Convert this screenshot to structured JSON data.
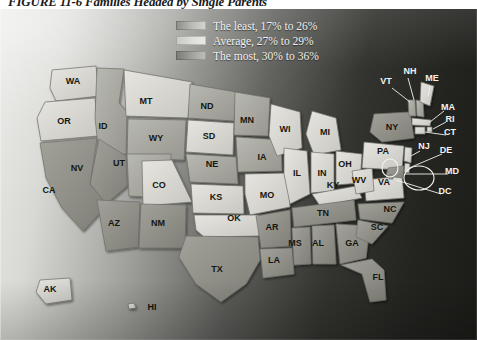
{
  "figure": {
    "title": "FIGURE 11-6  Families Headed by Single Parents"
  },
  "legend": {
    "items": [
      {
        "label": "The least, 17% to 26%",
        "swatch": "least",
        "range_low": 17,
        "range_high": 26
      },
      {
        "label": "Average, 27% to 29%",
        "swatch": "average",
        "range_low": 27,
        "range_high": 29
      },
      {
        "label": "The most, 30% to 36%",
        "swatch": "most",
        "range_low": 30,
        "range_high": 36
      }
    ]
  },
  "chart_data": {
    "type": "heatmap",
    "title": "FIGURE 11-6  Families Headed by Single Parents",
    "subtitle": "",
    "xlabel": "",
    "ylabel": "",
    "legend_position": "top-center",
    "grid": false,
    "categories": [
      "The least, 17% to 26%",
      "Average, 27% to 29%",
      "The most, 30% to 36%"
    ],
    "regions": [
      {
        "code": "WA",
        "class": "average"
      },
      {
        "code": "OR",
        "class": "average"
      },
      {
        "code": "CA",
        "class": "most"
      },
      {
        "code": "NV",
        "class": "most"
      },
      {
        "code": "ID",
        "class": "least"
      },
      {
        "code": "MT",
        "class": "average"
      },
      {
        "code": "WY",
        "class": "least"
      },
      {
        "code": "UT",
        "class": "least"
      },
      {
        "code": "AZ",
        "class": "most"
      },
      {
        "code": "CO",
        "class": "average"
      },
      {
        "code": "NM",
        "class": "most"
      },
      {
        "code": "ND",
        "class": "least"
      },
      {
        "code": "SD",
        "class": "average"
      },
      {
        "code": "NE",
        "class": "least"
      },
      {
        "code": "KS",
        "class": "average"
      },
      {
        "code": "OK",
        "class": "average"
      },
      {
        "code": "TX",
        "class": "most"
      },
      {
        "code": "MN",
        "class": "least"
      },
      {
        "code": "IA",
        "class": "least"
      },
      {
        "code": "MO",
        "class": "average"
      },
      {
        "code": "AR",
        "class": "most"
      },
      {
        "code": "LA",
        "class": "most"
      },
      {
        "code": "WI",
        "class": "average"
      },
      {
        "code": "IL",
        "class": "average"
      },
      {
        "code": "MI",
        "class": "average"
      },
      {
        "code": "IN",
        "class": "average"
      },
      {
        "code": "OH",
        "class": "average"
      },
      {
        "code": "KY",
        "class": "average"
      },
      {
        "code": "TN",
        "class": "most"
      },
      {
        "code": "MS",
        "class": "most"
      },
      {
        "code": "AL",
        "class": "most"
      },
      {
        "code": "GA",
        "class": "most"
      },
      {
        "code": "FL",
        "class": "most"
      },
      {
        "code": "SC",
        "class": "most"
      },
      {
        "code": "NC",
        "class": "most"
      },
      {
        "code": "VA",
        "class": "average"
      },
      {
        "code": "WV",
        "class": "average"
      },
      {
        "code": "PA",
        "class": "average"
      },
      {
        "code": "NY",
        "class": "most"
      },
      {
        "code": "VT",
        "class": "least"
      },
      {
        "code": "NH",
        "class": "least"
      },
      {
        "code": "ME",
        "class": "average"
      },
      {
        "code": "MA",
        "class": "average"
      },
      {
        "code": "RI",
        "class": "average"
      },
      {
        "code": "CT",
        "class": "average"
      },
      {
        "code": "NJ",
        "class": "average"
      },
      {
        "code": "DE",
        "class": "average"
      },
      {
        "code": "MD",
        "class": "most"
      },
      {
        "code": "DC",
        "class": "most"
      },
      {
        "code": "AK",
        "class": "average"
      },
      {
        "code": "HI",
        "class": "average"
      }
    ]
  },
  "map": {
    "inline_labels": [
      {
        "code": "WA",
        "x": 73,
        "y": 76
      },
      {
        "code": "MT",
        "x": 146,
        "y": 96
      },
      {
        "code": "ND",
        "x": 207,
        "y": 101
      },
      {
        "code": "OR",
        "x": 64,
        "y": 116
      },
      {
        "code": "ID",
        "x": 103,
        "y": 121
      },
      {
        "code": "MN",
        "x": 247,
        "y": 115
      },
      {
        "code": "WI",
        "x": 285,
        "y": 124
      },
      {
        "code": "MI",
        "x": 325,
        "y": 127
      },
      {
        "code": "WY",
        "x": 156,
        "y": 133
      },
      {
        "code": "SD",
        "x": 209,
        "y": 131
      },
      {
        "code": "NY",
        "x": 392,
        "y": 122
      },
      {
        "code": "NV",
        "x": 77,
        "y": 163
      },
      {
        "code": "UT",
        "x": 119,
        "y": 158
      },
      {
        "code": "NE",
        "x": 212,
        "y": 159
      },
      {
        "code": "IA",
        "x": 262,
        "y": 152
      },
      {
        "code": "IL",
        "x": 297,
        "y": 168
      },
      {
        "code": "IN",
        "x": 322,
        "y": 168
      },
      {
        "code": "OH",
        "x": 345,
        "y": 159
      },
      {
        "code": "PA",
        "x": 383,
        "y": 146
      },
      {
        "code": "CO",
        "x": 159,
        "y": 180
      },
      {
        "code": "KS",
        "x": 216,
        "y": 192
      },
      {
        "code": "MO",
        "x": 267,
        "y": 190
      },
      {
        "code": "KY",
        "x": 333,
        "y": 180
      },
      {
        "code": "WV",
        "x": 359,
        "y": 175
      },
      {
        "code": "VA",
        "x": 384,
        "y": 177
      },
      {
        "code": "CA",
        "x": 49,
        "y": 185
      },
      {
        "code": "AZ",
        "x": 114,
        "y": 218
      },
      {
        "code": "NM",
        "x": 158,
        "y": 218
      },
      {
        "code": "OK",
        "x": 234,
        "y": 213
      },
      {
        "code": "AR",
        "x": 272,
        "y": 222
      },
      {
        "code": "TN",
        "x": 323,
        "y": 208
      },
      {
        "code": "NC",
        "x": 390,
        "y": 204
      },
      {
        "code": "SC",
        "x": 377,
        "y": 222
      },
      {
        "code": "MS",
        "x": 295,
        "y": 238
      },
      {
        "code": "AL",
        "x": 318,
        "y": 238
      },
      {
        "code": "GA",
        "x": 352,
        "y": 238
      },
      {
        "code": "LA",
        "x": 274,
        "y": 255
      },
      {
        "code": "TX",
        "x": 217,
        "y": 264
      },
      {
        "code": "FL",
        "x": 378,
        "y": 272
      },
      {
        "code": "AK",
        "x": 50,
        "y": 284
      },
      {
        "code": "HI",
        "x": 152,
        "y": 302
      }
    ],
    "callout_labels": [
      {
        "code": "NH",
        "x": 410,
        "y": 66
      },
      {
        "code": "VT",
        "x": 386,
        "y": 76
      },
      {
        "code": "ME",
        "x": 432,
        "y": 73
      },
      {
        "code": "MA",
        "x": 448,
        "y": 102
      },
      {
        "code": "RI",
        "x": 450,
        "y": 114
      },
      {
        "code": "CT",
        "x": 450,
        "y": 127
      },
      {
        "code": "NJ",
        "x": 424,
        "y": 141
      },
      {
        "code": "DE",
        "x": 446,
        "y": 145
      },
      {
        "code": "MD",
        "x": 452,
        "y": 166
      },
      {
        "code": "DC",
        "x": 445,
        "y": 186
      }
    ]
  }
}
